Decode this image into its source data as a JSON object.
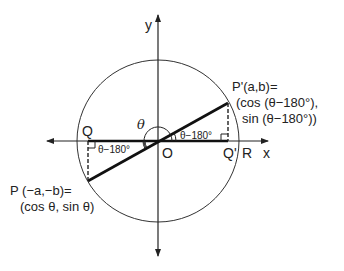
{
  "diagram": {
    "axes": {
      "x_label": "x",
      "y_label": "y"
    },
    "points": {
      "origin": "O",
      "Q": "Q",
      "Q_prime": "Q'",
      "R": "R"
    },
    "p_prime_label": {
      "line1": "P'(a,b)=",
      "line2": "(cos (θ−180°),",
      "line3": "sin (θ−180°))"
    },
    "p_label": {
      "line1": "P (−a,−b)=",
      "line2": "(cos θ, sin θ)"
    },
    "angles": {
      "theta": "θ",
      "right_angle": "θ−180°",
      "left_angle": "θ−180°"
    },
    "colors": {
      "stroke": "#222222",
      "background": "#ffffff"
    }
  }
}
